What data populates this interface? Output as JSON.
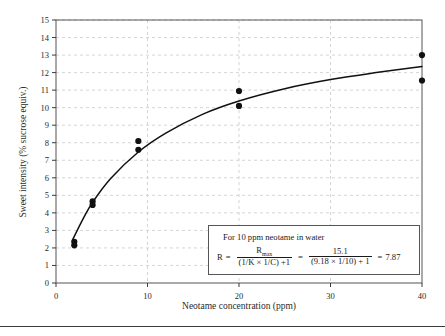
{
  "chart_data": {
    "type": "scatter",
    "title": "",
    "xlabel": "Neotame concentration (ppm)",
    "ylabel": "Sweet intensity (% sucrose equiv.)",
    "xlim": [
      0,
      40
    ],
    "ylim": [
      0,
      15
    ],
    "xticks": [
      0,
      10,
      20,
      30,
      40
    ],
    "yticks": [
      0,
      1,
      2,
      3,
      4,
      5,
      6,
      7,
      8,
      9,
      10,
      11,
      12,
      13,
      14,
      15
    ],
    "xtick_labels": [
      "0",
      "10",
      "20",
      "30",
      "40"
    ],
    "ytick_labels": [
      "0",
      "1",
      "2",
      "3",
      "4",
      "5",
      "6",
      "7",
      "8",
      "9",
      "10",
      "11",
      "12",
      "13",
      "14",
      "15"
    ],
    "grid": "dashed, both axes, light gray",
    "legend": "none",
    "series": [
      {
        "name": "Observed sweet intensity",
        "marker": "filled circle",
        "color": "#111111",
        "points": [
          {
            "x": 2,
            "y": 2.35
          },
          {
            "x": 2,
            "y": 2.15
          },
          {
            "x": 4,
            "y": 4.65
          },
          {
            "x": 4,
            "y": 4.45
          },
          {
            "x": 9,
            "y": 8.1
          },
          {
            "x": 9,
            "y": 7.6
          },
          {
            "x": 20,
            "y": 10.95
          },
          {
            "x": 20,
            "y": 10.1
          },
          {
            "x": 40,
            "y": 13.0
          },
          {
            "x": 40,
            "y": 11.55
          }
        ]
      },
      {
        "name": "Fitted saturation curve",
        "marker": "none",
        "type": "line",
        "color": "#111111",
        "model": "R = Rmax / ((1/K x 1/C) + 1)",
        "Rmax": 15.1,
        "one_over_K": 9.18,
        "curve_points": [
          {
            "x": 1.8,
            "y": 2.45
          },
          {
            "x": 3,
            "y": 3.7
          },
          {
            "x": 4,
            "y": 4.6
          },
          {
            "x": 6,
            "y": 5.97
          },
          {
            "x": 9,
            "y": 7.47
          },
          {
            "x": 12,
            "y": 8.55
          },
          {
            "x": 16,
            "y": 9.62
          },
          {
            "x": 20,
            "y": 10.38
          },
          {
            "x": 25,
            "y": 11.08
          },
          {
            "x": 30,
            "y": 11.6
          },
          {
            "x": 35,
            "y": 12.0
          },
          {
            "x": 40,
            "y": 12.35
          }
        ]
      }
    ],
    "annotation_box": {
      "line1": "For 10 ppm  neotame in water",
      "formula_lead": "R",
      "equals_1": "=",
      "frac1_num": "R",
      "frac1_num_sub": "max",
      "frac1_den": "(1/K × 1/C) +1",
      "equals_2": "=",
      "frac2_num": "15.1",
      "frac2_den": "(9.18 × 1/10) + 1",
      "equals_3": "=",
      "result": "7.87"
    }
  },
  "figure": {
    "axis_color": "#3a3a3a",
    "grid_color": "#c9c9c9",
    "marker_color": "#111111",
    "curve_color": "#111111",
    "background": "#ffffff"
  }
}
